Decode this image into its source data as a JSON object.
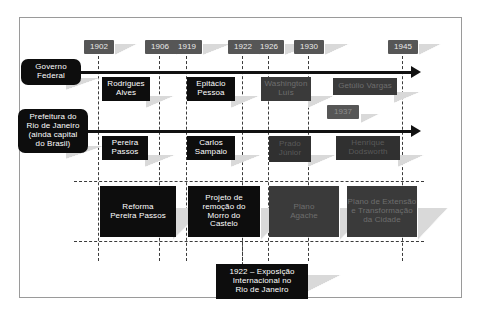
{
  "diagram": {
    "colors": {
      "box_dark": "#0d0d0d",
      "box_gray": "#4a4a4a",
      "year_chip": "#565656",
      "axis": "#111111",
      "gridline": "#3b3b3b",
      "frame": "#9a9a9a",
      "background": "#ffffff"
    }
  },
  "years": [
    {
      "label": "1902"
    },
    {
      "label": "1906"
    },
    {
      "label": "1919"
    },
    {
      "label": "1922"
    },
    {
      "label": "1926"
    },
    {
      "label": "1930"
    },
    {
      "label": "1945"
    }
  ],
  "year_inline": {
    "label": "1937"
  },
  "rows": [
    {
      "id": "governo-federal",
      "label": "Governo\nFederal",
      "entries": [
        {
          "label": "Rodrigues\nAlves"
        },
        {
          "label": "Epitácio\nPessoa"
        },
        {
          "label": "Washington\nLuís"
        },
        {
          "label": "Getúlio Vargas"
        }
      ]
    },
    {
      "id": "prefeitura-rio",
      "label": "Prefeitura do\nRio de Janeiro\n(ainda capital\ndo Brasil)",
      "entries": [
        {
          "label": "Pereira\nPassos"
        },
        {
          "label": "Carlos\nSampaio"
        },
        {
          "label": "Prado\nJúnior"
        },
        {
          "label": "Henrique\nDodsworth"
        }
      ]
    }
  ],
  "projects": [
    {
      "label": "Reforma\nPereira Passos"
    },
    {
      "label": "Projeto de\nremoção do\nMorro do\nCastelo"
    },
    {
      "label": "Plano\nAgache"
    },
    {
      "label": "Plano de Extensão\ne Transformação\nda Cidade"
    }
  ],
  "caption": {
    "label": "1922 – Exposição\nInternacional no\nRio de Janeiro"
  }
}
